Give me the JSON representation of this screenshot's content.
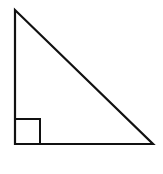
{
  "diagram": {
    "type": "right-triangle",
    "background": "#ffffff",
    "stroke_color": "#111111",
    "stroke_width": 2.2,
    "vertices": {
      "top": [
        15,
        10
      ],
      "right_angle": [
        15,
        144
      ],
      "bottom_right": [
        153,
        144
      ]
    },
    "right_angle_marker": {
      "x": 15,
      "y": 119,
      "size": 25
    }
  }
}
